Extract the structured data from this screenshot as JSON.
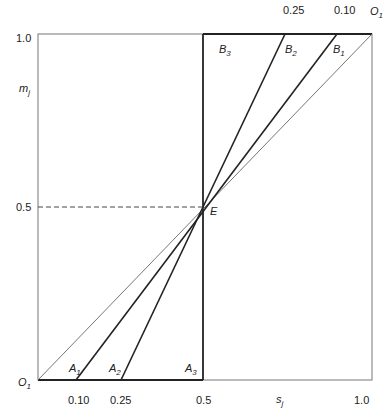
{
  "diagram": {
    "axes": {
      "x_label": "s",
      "x_label_sub": "j",
      "y_label": "m",
      "y_label_sub": "j",
      "x_ticks": [
        "0.10",
        "0.25",
        "0.5",
        "1.0"
      ],
      "y_ticks": [
        "1.0",
        "0.5"
      ],
      "top_ticks": [
        "0.25",
        "0.10"
      ]
    },
    "origin_bottom_left": {
      "label": "O",
      "sub": "1"
    },
    "origin_top_right": {
      "label": "O",
      "sub": "1"
    },
    "center_point": {
      "label": "E",
      "x": 0.5,
      "y": 0.5
    },
    "lower_labels": [
      {
        "label": "A",
        "sub": "1"
      },
      {
        "label": "A",
        "sub": "2"
      },
      {
        "label": "A",
        "sub": "3"
      }
    ],
    "upper_labels": [
      {
        "label": "B",
        "sub": "3"
      },
      {
        "label": "B",
        "sub": "2"
      },
      {
        "label": "B",
        "sub": "1"
      }
    ],
    "lines": [
      {
        "name": "A1-B1",
        "from_x": 0.1,
        "to_x": 0.9,
        "weight": "thick"
      },
      {
        "name": "A2-B2",
        "from_x": 0.25,
        "to_x": 0.75,
        "weight": "thick"
      },
      {
        "name": "A3-B3",
        "from_x": 0.5,
        "to_x": 0.5,
        "weight": "thick"
      },
      {
        "name": "diagonal",
        "from_x": 0.0,
        "to_x": 1.0,
        "weight": "thin"
      }
    ]
  }
}
